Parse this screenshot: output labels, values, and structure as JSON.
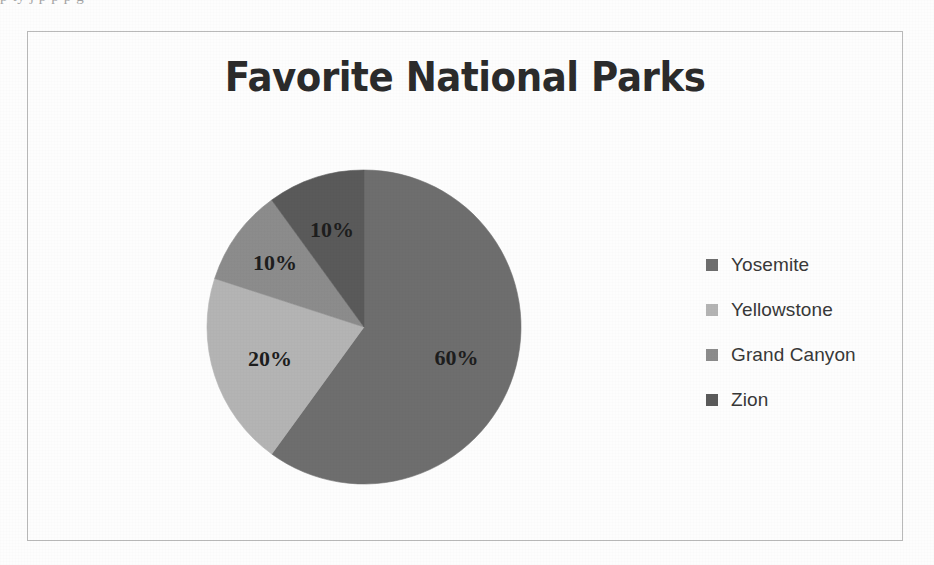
{
  "page": {
    "background_color": "#fdfdfd",
    "cutoff_text_top": "p  ty      j              p  p            p      g"
  },
  "chart_frame": {
    "border_color": "#b9b9b9"
  },
  "chart_data": {
    "type": "pie",
    "title": "Favorite National Parks",
    "xlabel": "",
    "ylabel": "",
    "legend_position": "right",
    "grid": false,
    "start_angle_deg": 0,
    "direction": "clockwise",
    "categories": [
      "Yosemite",
      "Yellowstone",
      "Grand Canyon",
      "Zion"
    ],
    "values": [
      60,
      20,
      10,
      10
    ],
    "value_labels": [
      "60%",
      "20%",
      "10%",
      "10%"
    ],
    "colors": [
      "#6e6e6e",
      "#b4b4b4",
      "#8c8c8c",
      "#5a5a5a"
    ],
    "slices": [
      {
        "label": "Yosemite",
        "value": 60,
        "value_label": "60%",
        "color": "#6e6e6e"
      },
      {
        "label": "Yellowstone",
        "value": 20,
        "value_label": "20%",
        "color": "#b4b4b4"
      },
      {
        "label": "Grand Canyon",
        "value": 10,
        "value_label": "10%",
        "color": "#8c8c8c"
      },
      {
        "label": "Zion",
        "value": 10,
        "value_label": "10%",
        "color": "#5a5a5a"
      }
    ]
  },
  "legend": {
    "items": [
      {
        "label": "Yosemite",
        "color": "#6e6e6e"
      },
      {
        "label": "Yellowstone",
        "color": "#b4b4b4"
      },
      {
        "label": "Grand Canyon",
        "color": "#8c8c8c"
      },
      {
        "label": "Zion",
        "color": "#5a5a5a"
      }
    ]
  }
}
